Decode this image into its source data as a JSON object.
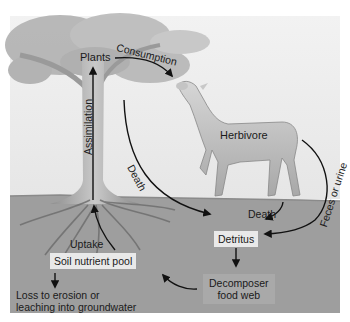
{
  "figure": {
    "colors": {
      "sky": "#efefef",
      "soil": "#9e9e9e",
      "arrow": "#111111",
      "label_box_light": "#e9e9e9",
      "label_box_mid": "#a9a9a9",
      "tree_foliage": "#b8b8b8",
      "tree_trunk": "#a4a4a4",
      "herbivore": "#bdbdbd"
    }
  },
  "nodes": {
    "plants": "Plants",
    "herbivore": "Herbivore",
    "detritus": "Detritus",
    "soil_pool": "Soil nutrient pool",
    "decomposer_line1": "Decomposer",
    "decomposer_line2": "food web",
    "loss_line1": "Loss to erosion or",
    "loss_line2": "leaching into groundwater"
  },
  "flows": {
    "consumption": "Consumption",
    "assimilation": "Assimilation",
    "plant_death": "Death",
    "herbivore_death": "Death",
    "feces": "Feces or urine",
    "uptake": "Uptake"
  },
  "edges": [
    {
      "from": "Plants",
      "to": "Herbivore",
      "label": "Consumption"
    },
    {
      "from": "Soil nutrient pool",
      "to": "Plants",
      "label": "Uptake / Assimilation"
    },
    {
      "from": "Plants",
      "to": "Detritus",
      "label": "Death"
    },
    {
      "from": "Herbivore",
      "to": "Detritus",
      "label": "Death"
    },
    {
      "from": "Herbivore",
      "to": "Detritus",
      "label": "Feces or urine"
    },
    {
      "from": "Detritus",
      "to": "Decomposer food web",
      "label": ""
    },
    {
      "from": "Decomposer food web",
      "to": "Soil nutrient pool",
      "label": ""
    },
    {
      "from": "Soil nutrient pool",
      "to": "Loss to erosion or leaching into groundwater",
      "label": ""
    }
  ]
}
